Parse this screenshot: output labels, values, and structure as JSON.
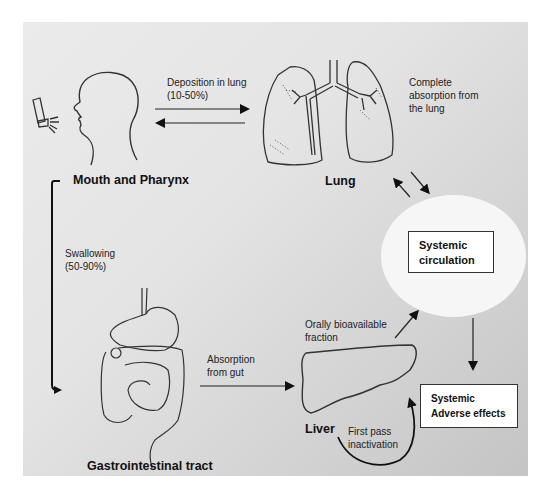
{
  "figure": {
    "nodes": {
      "mouth": {
        "label": "Mouth and Pharynx"
      },
      "lung": {
        "label": "Lung"
      },
      "gi": {
        "label": "Gastrointestinal tract"
      },
      "liver": {
        "label": "Liver"
      },
      "systemic_circulation": {
        "label": "Systemic\ncirculation"
      },
      "adverse_effects": {
        "label": "Systemic\nAdverse effects"
      }
    },
    "edges": {
      "deposition": {
        "label": "Deposition in lung\n(10-50%)"
      },
      "lung_absorption": {
        "label": "Complete\nabsorption from\n the lung"
      },
      "swallowing": {
        "label": "Swallowing\n(50-90%)"
      },
      "gut_absorption": {
        "label": "Absorption\nfrom gut"
      },
      "oral_fraction": {
        "label": "Orally bioavailable\nfraction"
      },
      "first_pass": {
        "label": "First pass\n inactivation"
      }
    },
    "icons": [
      "inhaler-icon",
      "head-profile-icon",
      "lungs-icon",
      "intestines-icon",
      "liver-icon"
    ],
    "colors": {
      "background": "#e4e4e4",
      "circle": "#f6f6f6",
      "box": "#ffffff",
      "stroke": "#1a1a1a"
    }
  }
}
